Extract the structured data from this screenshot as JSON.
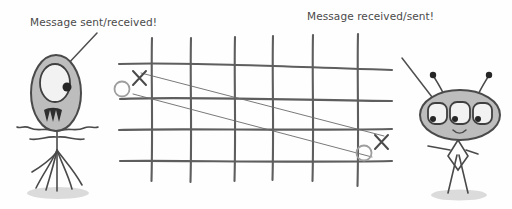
{
  "scene": {
    "title": "Message sent/received diagram",
    "background_color": "#fefefe",
    "ink_color": "#555555",
    "width": 512,
    "height": 209
  },
  "labels": {
    "left": "Message sent/received!",
    "right": "Message received/sent!"
  },
  "grid": {
    "vertical_count": 6,
    "horizontal_count": 4,
    "line_color": "#5e5e5e"
  },
  "marks": {
    "left_o": "O",
    "left_x": "X",
    "right_o": "O",
    "right_x": "X",
    "o_color": "#9e9e9e",
    "x_color": "#4a4a4a"
  },
  "characters": {
    "left": {
      "name": "one-eyed-tall-alien",
      "eye_count": 1,
      "fill_color": "#bdbdbd"
    },
    "right": {
      "name": "three-eyed-wide-alien",
      "eye_count": 3,
      "antenna_count": 2,
      "fill_color": "#bdbdbd"
    }
  },
  "message_lines": {
    "count": 2,
    "color": "#6a6a6a"
  }
}
